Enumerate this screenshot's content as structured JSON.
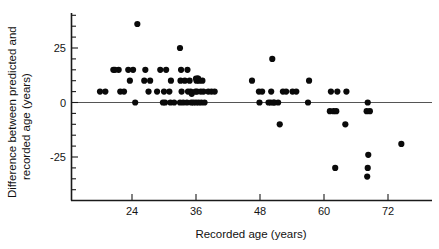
{
  "chart_data": {
    "type": "scatter",
    "title": "",
    "subtitle": "",
    "xlabel": "Recorded age (years)",
    "ylabel": "Difference between predicted and recorded age (years)",
    "ylabel_line1": "Difference between predicted and",
    "ylabel_line2": "recorded age (years)",
    "xlim": [
      16,
      78
    ],
    "ylim": [
      -43,
      41
    ],
    "xticks": [
      24,
      36,
      48,
      60,
      72
    ],
    "xtick_labels": [
      "24",
      "36",
      "48",
      "60",
      "72"
    ],
    "yticks": [
      25,
      0,
      -25
    ],
    "ytick_labels": [
      "25",
      "0",
      "-25"
    ],
    "y_minor_ticks": [
      40,
      35,
      30,
      20,
      15,
      10,
      5,
      -5,
      -10,
      -15,
      -20,
      -30,
      -35,
      -40
    ],
    "grid": false,
    "legend": null,
    "zero_reference_line": 0,
    "marker": "filled-circle",
    "marker_color": "#0a0a0a",
    "marker_size_px": 3.1,
    "n_points": 89,
    "points": [
      [
        18.0,
        5
      ],
      [
        19.0,
        5
      ],
      [
        20.5,
        15
      ],
      [
        21.5,
        15
      ],
      [
        21.8,
        5
      ],
      [
        23.3,
        15
      ],
      [
        24.2,
        15
      ],
      [
        23.6,
        10
      ],
      [
        25.0,
        36
      ],
      [
        24.6,
        0
      ],
      [
        26.5,
        15
      ],
      [
        26.3,
        10
      ],
      [
        27.4,
        10
      ],
      [
        27.1,
        5
      ],
      [
        28.7,
        5
      ],
      [
        29.3,
        15
      ],
      [
        30.4,
        15
      ],
      [
        31.3,
        10
      ],
      [
        31.0,
        5
      ],
      [
        31.2,
        0
      ],
      [
        31.9,
        0
      ],
      [
        33.0,
        25
      ],
      [
        33.2,
        15
      ],
      [
        33.1,
        10
      ],
      [
        33.3,
        5
      ],
      [
        33.0,
        0
      ],
      [
        33.6,
        0
      ],
      [
        34.4,
        15
      ],
      [
        34.5,
        5
      ],
      [
        34.3,
        0
      ],
      [
        35.0,
        5
      ],
      [
        35.2,
        4
      ],
      [
        35.1,
        0
      ],
      [
        36.1,
        10
      ],
      [
        36.3,
        11
      ],
      [
        36.6,
        10
      ],
      [
        36.2,
        5
      ],
      [
        36.0,
        0
      ],
      [
        36.5,
        0
      ],
      [
        37.2,
        10
      ],
      [
        37.4,
        5
      ],
      [
        37.0,
        0
      ],
      [
        37.6,
        0
      ],
      [
        38.3,
        5
      ],
      [
        38.9,
        5
      ],
      [
        39.5,
        5
      ],
      [
        46.5,
        10
      ],
      [
        47.8,
        5
      ],
      [
        48.4,
        5
      ],
      [
        47.9,
        0
      ],
      [
        50.3,
        20
      ],
      [
        50.1,
        5
      ],
      [
        50.0,
        0
      ],
      [
        50.7,
        0
      ],
      [
        51.4,
        0
      ],
      [
        51.7,
        -10
      ],
      [
        52.3,
        5
      ],
      [
        52.9,
        5
      ],
      [
        54.1,
        5
      ],
      [
        54.8,
        5
      ],
      [
        57.2,
        10
      ],
      [
        57.0,
        0
      ],
      [
        61.3,
        5
      ],
      [
        61.1,
        -4
      ],
      [
        61.8,
        -4
      ],
      [
        62.3,
        -4
      ],
      [
        62.5,
        5
      ],
      [
        62.1,
        -30
      ],
      [
        64.2,
        5
      ],
      [
        64.0,
        -10
      ],
      [
        68.2,
        0
      ],
      [
        68.0,
        -4
      ],
      [
        68.6,
        -4
      ],
      [
        68.3,
        -24
      ],
      [
        68.2,
        -30
      ],
      [
        68.1,
        -34
      ],
      [
        74.5,
        -19
      ],
      [
        30.0,
        5
      ],
      [
        30.2,
        0
      ],
      [
        29.8,
        0
      ],
      [
        22.5,
        5
      ],
      [
        20.8,
        15
      ],
      [
        33.9,
        10
      ],
      [
        34.8,
        10
      ],
      [
        36.4,
        11
      ],
      [
        36.0,
        11
      ],
      [
        35.9,
        5
      ],
      [
        35.5,
        0
      ],
      [
        49.6,
        0
      ],
      [
        50.5,
        0
      ],
      [
        36.9,
        5
      ]
    ]
  },
  "axis": {
    "x_axis_name": "x-axis",
    "y_axis_name": "y-axis"
  }
}
